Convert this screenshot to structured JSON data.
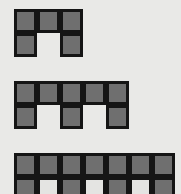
{
  "diagram": {
    "type": "figure-sequence",
    "colors": {
      "background": "#e9e9e7",
      "filled_cell": "#6f6f6f",
      "border": "#151515",
      "empty_cell": "#e4e4e2"
    },
    "figures": [
      {
        "index": 1,
        "columns": 3,
        "rows": [
          [
            1,
            1,
            1
          ],
          [
            1,
            0,
            1
          ]
        ],
        "left": 14,
        "top": 9
      },
      {
        "index": 2,
        "columns": 5,
        "rows": [
          [
            1,
            1,
            1,
            1,
            1
          ],
          [
            1,
            0,
            1,
            0,
            1
          ]
        ],
        "left": 14,
        "top": 81
      },
      {
        "index": 3,
        "columns": 7,
        "rows": [
          [
            1,
            1,
            1,
            1,
            1,
            1,
            1
          ],
          [
            1,
            2,
            1,
            2,
            1,
            2,
            1
          ]
        ],
        "left": 14,
        "top": 153
      }
    ],
    "legend": {
      "1": "filled square",
      "0": "gap (no square)",
      "2": "outlined empty square"
    }
  }
}
